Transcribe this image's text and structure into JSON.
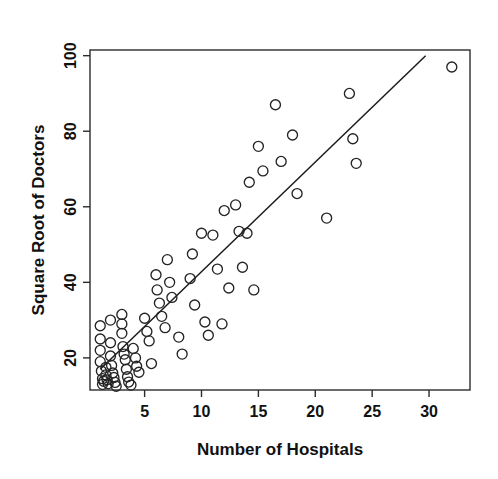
{
  "chart_data": {
    "type": "scatter",
    "title": "",
    "xlabel": "Number of Hospitals",
    "ylabel": "Square Root of Doctors",
    "xlim": [
      0.2,
      33.6
    ],
    "ylim": [
      11.5,
      101.5
    ],
    "xticks": [
      5,
      10,
      15,
      20,
      25,
      30
    ],
    "xtick_labels": [
      "5",
      "10",
      "15",
      "20",
      "25",
      "30"
    ],
    "yticks": [
      20,
      40,
      60,
      80,
      100
    ],
    "ytick_labels": [
      "20",
      "40",
      "60",
      "80",
      "100"
    ],
    "grid": false,
    "legend": null,
    "marker": "open-circle",
    "marker_size": 10,
    "point_color": "#242424",
    "line_color": "#1b1b1b",
    "series": [
      {
        "name": "Hospitals vs Square Root of Doctors",
        "points": [
          [
            1.1,
            28.5
          ],
          [
            1.1,
            25.0
          ],
          [
            1.1,
            22.0
          ],
          [
            1.1,
            19.0
          ],
          [
            1.2,
            16.5
          ],
          [
            1.3,
            14.5
          ],
          [
            1.3,
            13.0
          ],
          [
            1.4,
            13.8
          ],
          [
            1.6,
            17.5
          ],
          [
            1.6,
            15.5
          ],
          [
            1.7,
            14.2
          ],
          [
            1.8,
            13.2
          ],
          [
            2.0,
            30.0
          ],
          [
            2.0,
            24.0
          ],
          [
            2.0,
            20.5
          ],
          [
            2.1,
            18.0
          ],
          [
            2.2,
            16.0
          ],
          [
            2.3,
            14.8
          ],
          [
            2.4,
            13.5
          ],
          [
            2.5,
            12.5
          ],
          [
            3.0,
            31.5
          ],
          [
            3.0,
            29.0
          ],
          [
            3.0,
            26.5
          ],
          [
            3.1,
            23.0
          ],
          [
            3.2,
            21.0
          ],
          [
            3.3,
            19.5
          ],
          [
            3.4,
            17.0
          ],
          [
            3.5,
            15.0
          ],
          [
            3.6,
            13.6
          ],
          [
            3.8,
            12.8
          ],
          [
            4.0,
            22.5
          ],
          [
            4.2,
            20.0
          ],
          [
            4.3,
            17.8
          ],
          [
            4.5,
            16.2
          ],
          [
            5.0,
            30.5
          ],
          [
            5.2,
            27.0
          ],
          [
            5.4,
            24.5
          ],
          [
            5.6,
            18.5
          ],
          [
            6.0,
            42.0
          ],
          [
            6.1,
            38.0
          ],
          [
            6.3,
            34.5
          ],
          [
            6.5,
            31.0
          ],
          [
            6.8,
            28.0
          ],
          [
            7.0,
            46.0
          ],
          [
            7.2,
            40.0
          ],
          [
            7.4,
            36.0
          ],
          [
            8.0,
            25.5
          ],
          [
            8.3,
            21.0
          ],
          [
            9.0,
            41.0
          ],
          [
            9.2,
            47.5
          ],
          [
            9.4,
            34.0
          ],
          [
            10.0,
            53.0
          ],
          [
            10.3,
            29.5
          ],
          [
            10.6,
            26.0
          ],
          [
            11.0,
            52.5
          ],
          [
            11.4,
            43.5
          ],
          [
            11.8,
            29.0
          ],
          [
            12.0,
            59.0
          ],
          [
            12.4,
            38.5
          ],
          [
            13.0,
            60.5
          ],
          [
            13.3,
            53.5
          ],
          [
            13.6,
            44.0
          ],
          [
            14.0,
            53.0
          ],
          [
            14.2,
            66.5
          ],
          [
            14.6,
            38.0
          ],
          [
            15.0,
            76.0
          ],
          [
            15.4,
            69.5
          ],
          [
            16.5,
            87.0
          ],
          [
            17.0,
            72.0
          ],
          [
            18.0,
            79.0
          ],
          [
            18.4,
            63.5
          ],
          [
            21.0,
            57.0
          ],
          [
            23.0,
            90.0
          ],
          [
            23.3,
            78.0
          ],
          [
            23.6,
            71.5
          ],
          [
            32.0,
            97.0
          ]
        ]
      }
    ],
    "fit_line": {
      "name": "least-squares fit",
      "x_start": 1.1,
      "y_start": 17.0,
      "x_end": 29.7,
      "y_end": 100.0
    }
  }
}
